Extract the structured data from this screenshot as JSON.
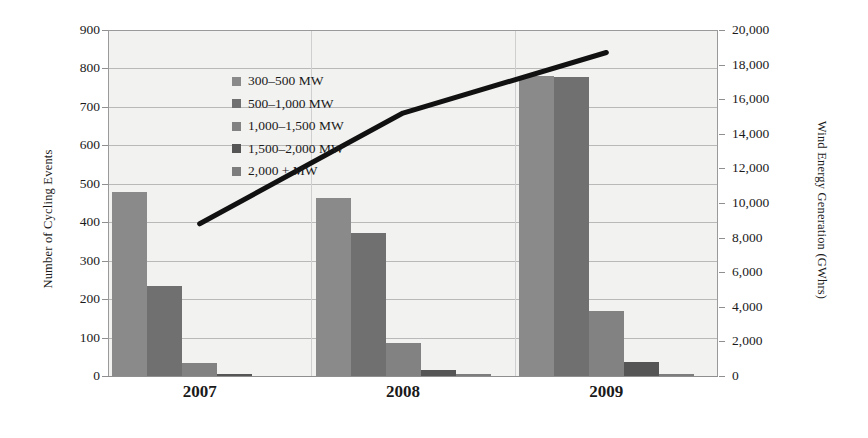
{
  "chart_data": {
    "type": "bar",
    "title": "",
    "categories": [
      "2007",
      "2008",
      "2009"
    ],
    "series": [
      {
        "name": "300–500 MW",
        "color": "#8a8a8a",
        "values": [
          478,
          462,
          780
        ]
      },
      {
        "name": "500–1,000 MW",
        "color": "#707070",
        "values": [
          233,
          373,
          778
        ]
      },
      {
        "name": "1,000–1,500 MW",
        "color": "#828282",
        "values": [
          35,
          87,
          168
        ]
      },
      {
        "name": "1,500–2,000 MW",
        "color": "#555555",
        "values": [
          5,
          15,
          37
        ]
      },
      {
        "name": "2,000 + MW",
        "color": "#7d7d7d",
        "values": [
          0,
          2,
          3
        ]
      }
    ],
    "line_series": {
      "name": "Wind Energy Generation",
      "color": "#111111",
      "values": [
        8800,
        15200,
        18700
      ]
    },
    "xlabel": "",
    "ylabel": "Number of Cycling Events",
    "y2label": "Wind Energy Generation (GWhrs)",
    "ylim": [
      0,
      900
    ],
    "y2lim": [
      0,
      20000
    ],
    "yticks": [
      "0",
      "100",
      "200",
      "300",
      "400",
      "500",
      "600",
      "700",
      "800",
      "900"
    ],
    "y2ticks": [
      "0",
      "2,000",
      "4,000",
      "6,000",
      "8,000",
      "10,000",
      "12,000",
      "14,000",
      "16,000",
      "18,000",
      "20,000"
    ],
    "grid": true,
    "legend_position": "top-left"
  }
}
